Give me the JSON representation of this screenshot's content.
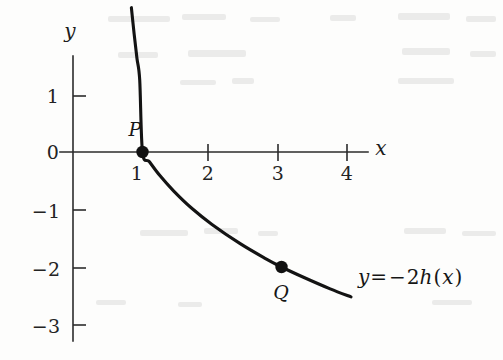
{
  "chart_data": {
    "type": "line",
    "title": "",
    "subtitle": "",
    "xlabel": "x",
    "ylabel": "y",
    "xlim": [
      0,
      4.3
    ],
    "ylim": [
      -3.4,
      2.6
    ],
    "grid": false,
    "legend_position": "curve-end-right",
    "x_ticks": [
      1,
      2,
      3,
      4
    ],
    "x_tick_labels": [
      "1",
      "2",
      "3",
      "4"
    ],
    "y_ticks": [
      1,
      0,
      -1,
      -2,
      -3
    ],
    "y_tick_labels": [
      "1",
      "0",
      "−1",
      "−2",
      "−3"
    ],
    "curve_expression": "y = -2*log3(x)",
    "series": [
      {
        "name": "y = −2h(x)",
        "x": [
          0.84,
          0.88,
          0.92,
          0.96,
          1.0,
          1.1,
          1.25,
          1.45,
          1.7,
          2.0,
          2.4,
          2.75,
          3.0,
          3.3,
          3.7,
          4.0
        ],
        "values": [
          2.51,
          2.05,
          1.63,
          1.25,
          0.0,
          -0.17,
          -0.41,
          -0.68,
          -0.97,
          -1.26,
          -1.59,
          -1.84,
          -2.0,
          -2.17,
          -2.38,
          -2.52
        ]
      }
    ],
    "annotations": [
      {
        "id": "point-p",
        "label": "P",
        "x": 1,
        "y": 0,
        "label_position": "above-left"
      },
      {
        "id": "point-q",
        "label": "Q",
        "x": 3,
        "y": -2,
        "label_position": "below"
      }
    ],
    "curve_equation": {
      "lhs": "y",
      "operator": "=",
      "rhs_sign": "−",
      "rhs_coefficient": "2",
      "rhs_function": "h",
      "rhs_argument": "x",
      "full": "y = −2h(x)"
    }
  },
  "axes": {
    "x_axis_name": "x",
    "y_axis_name": "y"
  },
  "colors": {
    "background": "#fdfdfc",
    "axis": "#2b2b2b",
    "curve": "#131313",
    "marker": "#111111",
    "text": "#1d1d1d"
  }
}
